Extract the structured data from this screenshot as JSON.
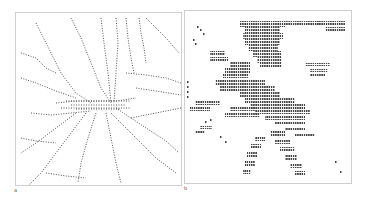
{
  "figure": {
    "panels": [
      {
        "label": "a",
        "description": "dotted character-path network radiating from a central hub",
        "ink_color": "#555555",
        "paths": [
          [
            [
              20,
              10
            ],
            [
              30,
              30
            ],
            [
              45,
              60
            ],
            [
              60,
              80
            ],
            [
              75,
              90
            ]
          ],
          [
            [
              55,
              5
            ],
            [
              65,
              25
            ],
            [
              75,
              50
            ],
            [
              85,
              75
            ],
            [
              95,
              90
            ]
          ],
          [
            [
              85,
              5
            ],
            [
              88,
              30
            ],
            [
              92,
              60
            ],
            [
              95,
              90
            ]
          ],
          [
            [
              100,
              5
            ],
            [
              102,
              30
            ],
            [
              100,
              60
            ],
            [
              98,
              90
            ]
          ],
          [
            [
              110,
              5
            ],
            [
              112,
              25
            ],
            [
              115,
              45
            ],
            [
              118,
              60
            ]
          ],
          [
            [
              123,
              5
            ],
            [
              125,
              20
            ],
            [
              128,
              35
            ],
            [
              130,
              50
            ]
          ],
          [
            [
              130,
              5
            ],
            [
              140,
              15
            ],
            [
              150,
              25
            ],
            [
              163,
              40
            ]
          ],
          [
            [
              5,
              40
            ],
            [
              20,
              45
            ],
            [
              30,
              55
            ],
            [
              40,
              60
            ]
          ],
          [
            [
              5,
              65
            ],
            [
              20,
              70
            ],
            [
              40,
              78
            ],
            [
              60,
              85
            ]
          ],
          [
            [
              40,
              90
            ],
            [
              60,
              88
            ],
            [
              80,
              88
            ],
            [
              100,
              88
            ],
            [
              120,
              85
            ]
          ],
          [
            [
              45,
              95
            ],
            [
              70,
              95
            ],
            [
              95,
              95
            ],
            [
              115,
              95
            ]
          ],
          [
            [
              15,
              100
            ],
            [
              35,
              102
            ],
            [
              55,
              100
            ],
            [
              75,
              98
            ]
          ],
          [
            [
              100,
              95
            ],
            [
              115,
              105
            ],
            [
              130,
              115
            ],
            [
              150,
              128
            ],
            [
              163,
              140
            ]
          ],
          [
            [
              95,
              100
            ],
            [
              110,
              115
            ],
            [
              125,
              130
            ],
            [
              140,
              145
            ],
            [
              160,
              160
            ]
          ],
          [
            [
              90,
              100
            ],
            [
              95,
              125
            ],
            [
              100,
              150
            ],
            [
              105,
              170
            ]
          ],
          [
            [
              80,
              100
            ],
            [
              72,
              125
            ],
            [
              65,
              150
            ],
            [
              62,
              170
            ]
          ],
          [
            [
              70,
              100
            ],
            [
              55,
              120
            ],
            [
              40,
              140
            ],
            [
              25,
              160
            ],
            [
              10,
              175
            ]
          ],
          [
            [
              60,
              100
            ],
            [
              40,
              115
            ],
            [
              20,
              130
            ],
            [
              5,
              140
            ]
          ],
          [
            [
              110,
              60
            ],
            [
              130,
              62
            ],
            [
              150,
              65
            ],
            [
              165,
              70
            ]
          ],
          [
            [
              120,
              75
            ],
            [
              140,
              78
            ],
            [
              165,
              82
            ]
          ],
          [
            [
              115,
              105
            ],
            [
              140,
              100
            ],
            [
              165,
              95
            ]
          ],
          [
            [
              30,
              160
            ],
            [
              50,
              163
            ],
            [
              70,
              165
            ]
          ],
          [
            [
              5,
              125
            ],
            [
              20,
              128
            ],
            [
              40,
              130
            ]
          ]
        ],
        "hub_lines": [
          [
            [
              50,
              88
            ],
            [
              115,
              88
            ]
          ],
          [
            [
              55,
              92
            ],
            [
              110,
              92
            ]
          ],
          [
            [
              60,
              96
            ],
            [
              105,
              96
            ]
          ]
        ]
      },
      {
        "label": "b",
        "description": "dense character-block figure",
        "ink_color": "#444444",
        "blocks": [
          [
            55,
            10,
            45,
            6
          ],
          [
            60,
            16,
            35,
            6
          ],
          [
            58,
            22,
            40,
            6
          ],
          [
            60,
            28,
            35,
            6
          ],
          [
            63,
            34,
            30,
            6
          ],
          [
            68,
            40,
            28,
            6
          ],
          [
            72,
            46,
            25,
            6
          ],
          [
            75,
            52,
            22,
            4
          ],
          [
            100,
            10,
            35,
            4
          ],
          [
            130,
            10,
            30,
            4
          ],
          [
            140,
            16,
            20,
            4
          ],
          [
            45,
            50,
            20,
            6
          ],
          [
            40,
            56,
            25,
            6
          ],
          [
            38,
            62,
            25,
            5
          ],
          [
            30,
            68,
            50,
            6
          ],
          [
            35,
            74,
            55,
            6
          ],
          [
            55,
            80,
            40,
            6
          ],
          [
            60,
            86,
            50,
            6
          ],
          [
            65,
            92,
            55,
            6
          ],
          [
            70,
            98,
            55,
            5
          ],
          [
            80,
            104,
            40,
            5
          ],
          [
            45,
            95,
            25,
            5
          ],
          [
            40,
            101,
            35,
            5
          ],
          [
            90,
            110,
            30,
            4
          ],
          [
            100,
            116,
            20,
            4
          ],
          [
            110,
            122,
            20,
            4
          ],
          [
            85,
            120,
            15,
            5
          ],
          [
            90,
            128,
            15,
            5
          ],
          [
            95,
            136,
            15,
            5
          ],
          [
            100,
            144,
            12,
            5
          ],
          [
            105,
            152,
            12,
            5
          ],
          [
            110,
            160,
            10,
            5
          ],
          [
            70,
            125,
            10,
            5
          ],
          [
            66,
            133,
            10,
            5
          ],
          [
            62,
            141,
            10,
            5
          ],
          [
            60,
            150,
            10,
            5
          ],
          [
            58,
            158,
            8,
            5
          ],
          [
            120,
            52,
            25,
            3
          ],
          [
            125,
            58,
            18,
            3
          ],
          [
            125,
            63,
            15,
            3
          ],
          [
            25,
            40,
            15,
            4
          ],
          [
            25,
            46,
            18,
            4
          ],
          [
            10,
            90,
            25,
            4
          ],
          [
            5,
            96,
            20,
            4
          ],
          [
            15,
            115,
            12,
            3
          ],
          [
            10,
            120,
            10,
            3
          ]
        ],
        "dots": [
          [
            12,
            15
          ],
          [
            15,
            18
          ],
          [
            18,
            22
          ],
          [
            8,
            28
          ],
          [
            10,
            32
          ],
          [
            2,
            70
          ],
          [
            2,
            75
          ],
          [
            2,
            80
          ],
          [
            2,
            85
          ],
          [
            20,
            110
          ],
          [
            25,
            108
          ],
          [
            35,
            125
          ],
          [
            40,
            130
          ],
          [
            150,
            150
          ],
          [
            155,
            160
          ]
        ]
      }
    ]
  }
}
